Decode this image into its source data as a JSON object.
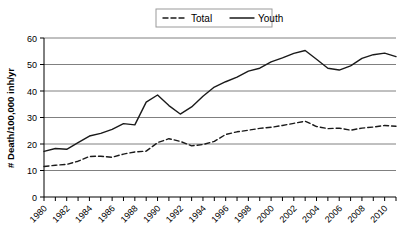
{
  "chart_data": {
    "type": "line",
    "title": "",
    "xlabel": "",
    "ylabel": "# Death/100,000 inh/yr",
    "ylim": [
      0,
      60
    ],
    "yticks": [
      0,
      10,
      20,
      30,
      40,
      50,
      60
    ],
    "xlim": [
      1980,
      2011
    ],
    "grid": true,
    "legend_position": "top-center",
    "x": [
      1980,
      1981,
      1982,
      1983,
      1984,
      1985,
      1986,
      1987,
      1988,
      1989,
      1990,
      1991,
      1992,
      1993,
      1994,
      1995,
      1996,
      1997,
      1998,
      1999,
      2000,
      2001,
      2002,
      2003,
      2004,
      2005,
      2006,
      2007,
      2008,
      2009,
      2010,
      2011
    ],
    "xtick_labels": [
      "1980",
      "1982",
      "1984",
      "1986",
      "1988",
      "1990",
      "1992",
      "1994",
      "1996",
      "1998",
      "2000",
      "2002",
      "2004",
      "2006",
      "2008",
      "2010"
    ],
    "series": [
      {
        "name": "Total",
        "style": "dashed",
        "values": [
          11.5,
          12.0,
          12.3,
          13.5,
          15.3,
          15.4,
          15.0,
          16.2,
          17.0,
          17.3,
          20.5,
          22.0,
          21.0,
          19.3,
          19.8,
          21.0,
          23.6,
          24.6,
          25.2,
          25.9,
          26.3,
          27.0,
          27.8,
          28.6,
          26.6,
          25.8,
          26.0,
          25.2,
          26.0,
          26.4,
          27.0,
          26.7
        ]
      },
      {
        "name": "Youth",
        "style": "solid",
        "values": [
          17.2,
          18.3,
          18.0,
          20.5,
          23.0,
          24.0,
          25.5,
          27.7,
          27.2,
          35.8,
          38.5,
          34.5,
          31.3,
          34.0,
          38.0,
          41.5,
          43.5,
          45.2,
          47.5,
          48.6,
          51.0,
          52.5,
          54.2,
          55.3,
          52.0,
          48.6,
          47.9,
          49.5,
          52.3,
          53.7,
          54.3,
          53.0
        ]
      }
    ],
    "legend": [
      {
        "label": "Total",
        "style": "dashed"
      },
      {
        "label": "Youth",
        "style": "solid"
      }
    ]
  },
  "colors": {
    "line": "#1a1a1a",
    "grid": "#808080",
    "axis": "#000000",
    "legend_border": "#9a9a9a",
    "background": "#ffffff"
  }
}
